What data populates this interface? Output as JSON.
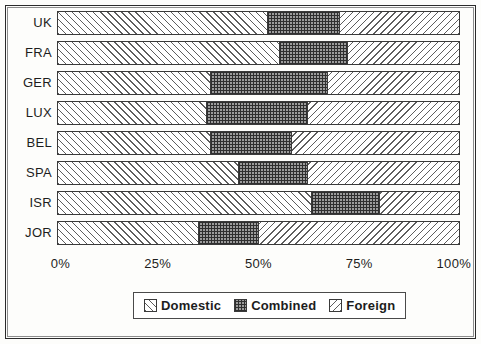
{
  "chart_data": {
    "type": "bar",
    "subtype": "stacked-horizontal-100-percent",
    "title": "",
    "xlabel": "",
    "ylabel": "",
    "xlim": [
      0,
      100
    ],
    "grid": false,
    "legend_position": "bottom-center",
    "unit": "%",
    "categories": [
      "UK",
      "FRA",
      "GER",
      "LUX",
      "BEL",
      "SPA",
      "ISR",
      "JOR"
    ],
    "xticks": [
      "0%",
      "25%",
      "50%",
      "75%",
      "100%"
    ],
    "xtick_values": [
      0,
      25,
      50,
      75,
      100
    ],
    "series": [
      {
        "name": "Domestic",
        "pattern": "forward-diagonal-hatch",
        "values": [
          52,
          55,
          38,
          37,
          38,
          45,
          63,
          35
        ]
      },
      {
        "name": "Combined",
        "pattern": "checkerboard",
        "values": [
          18,
          17,
          29,
          25,
          20,
          17,
          17,
          15
        ]
      },
      {
        "name": "Foreign",
        "pattern": "backward-diagonal-hatch",
        "values": [
          30,
          28,
          33,
          38,
          42,
          38,
          20,
          50
        ]
      }
    ],
    "legend": [
      {
        "label": "Domestic",
        "pattern": "forward-diagonal-hatch"
      },
      {
        "label": "Combined",
        "pattern": "checkerboard"
      },
      {
        "label": "Foreign",
        "pattern": "backward-diagonal-hatch"
      }
    ],
    "colors": {
      "ink": "#1d1d1d",
      "bar_outline": "#3a3a3a",
      "hatch": "#5d5d5d",
      "combined_fill": "#9c9c9c",
      "background": "#fdfdfb"
    }
  }
}
